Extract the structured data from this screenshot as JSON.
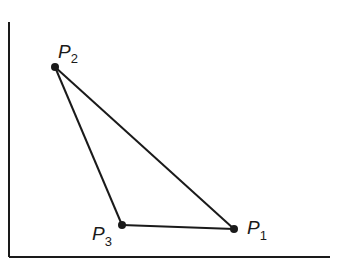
{
  "diagram": {
    "type": "triangle-in-axes",
    "colors": {
      "ink": "#1a1a1a",
      "background": "#ffffff"
    },
    "axes": {
      "origin": [
        9,
        257
      ],
      "y_axis_top": [
        9,
        22
      ],
      "x_axis_right": [
        330,
        257
      ]
    },
    "points": [
      {
        "id": "P1",
        "label": "P",
        "subscript": "1",
        "x": 234,
        "y": 229
      },
      {
        "id": "P2",
        "label": "P",
        "subscript": "2",
        "x": 55,
        "y": 67
      },
      {
        "id": "P3",
        "label": "P",
        "subscript": "3",
        "x": 122,
        "y": 225
      }
    ],
    "edges": [
      [
        "P1",
        "P2"
      ],
      [
        "P2",
        "P3"
      ],
      [
        "P3",
        "P1"
      ]
    ]
  }
}
